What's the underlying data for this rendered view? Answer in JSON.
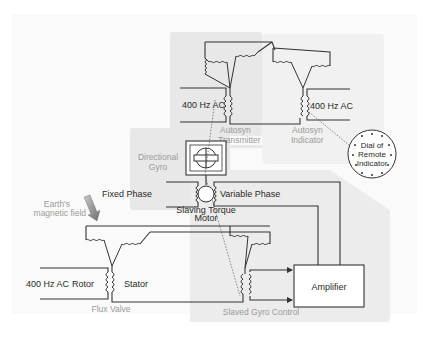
{
  "diagram": {
    "regions": {
      "transmitter_region": "Autosyn Transmitter area",
      "indicator_region": "Autosyn Indicator area",
      "gyro_control_region": "Slaved Gyro Control area"
    },
    "labels": {
      "ac_transmitter": "400 Hz AC",
      "autosyn_transmitter_1": "Autosyn",
      "autosyn_transmitter_2": "Transmitter",
      "ac_indicator": "400 Hz AC",
      "autosyn_indicator_1": "Autosyn",
      "autosyn_indicator_2": "Indicator",
      "dial_1": "Dial of",
      "dial_2": "Remote",
      "dial_3": "Indicator",
      "directional_gyro_1": "Directional",
      "directional_gyro_2": "Gyro",
      "fixed_phase": "Fixed Phase",
      "variable_phase": "Variable Phase",
      "slaving_torque_1": "Slaving Torque",
      "slaving_torque_2": "Motor",
      "earth_field_1": "Earth's",
      "earth_field_2": "magnetic field",
      "ac_rotor": "400 Hz AC",
      "rotor": "Rotor",
      "stator": "Stator",
      "flux_valve": "Flux Valve",
      "amplifier": "Amplifier",
      "slaved_gyro_control": "Slaved Gyro Control"
    },
    "colors": {
      "region_fill": "#ececec",
      "region_fill_light": "#f3f3f3",
      "wire": "#333333",
      "gray_label": "#9a9a9a",
      "arrow": "#8a8a8a"
    }
  }
}
